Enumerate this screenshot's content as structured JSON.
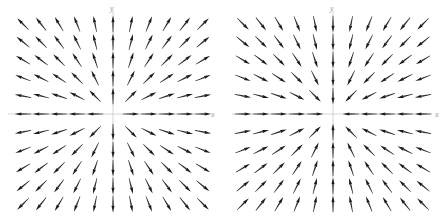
{
  "figure": {
    "width": 448,
    "height": 218,
    "background": "#ffffff",
    "panel_count": 2
  },
  "chart_data": [
    {
      "type": "scatter",
      "subtype": "quiver",
      "name": "outward-radial-vector-field",
      "title": "",
      "xlabel": "x",
      "ylabel": "y",
      "xlim": [
        -5,
        5
      ],
      "ylim": [
        -5,
        5
      ],
      "grid": false,
      "legend": null,
      "axis_color": "#cfcfcf",
      "arrow_color": "#262626",
      "description": "Radially outward (source) vector field: arrows point away from the origin",
      "field_direction": "outward",
      "field_formula": "F(x,y) = (x, y)",
      "grid_columns": 11,
      "grid_rows": 11,
      "x": [
        -5,
        -4,
        -3,
        -2,
        -1,
        0,
        1,
        2,
        3,
        4,
        5
      ],
      "y": [
        -5,
        -4,
        -3,
        -2,
        -1,
        0,
        1,
        2,
        3,
        4,
        5
      ],
      "arrow_length_mode": "uniform",
      "origin_arrow": "none"
    },
    {
      "type": "scatter",
      "subtype": "quiver",
      "name": "inward-radial-vector-field",
      "title": "",
      "xlabel": "x",
      "ylabel": "y",
      "xlim": [
        -5,
        5
      ],
      "ylim": [
        -5,
        5
      ],
      "grid": false,
      "legend": null,
      "axis_color": "#cfcfcf",
      "arrow_color": "#262626",
      "description": "Radially inward (sink) vector field: arrows point toward the origin",
      "field_direction": "inward",
      "field_formula": "F(x,y) = (-x, -y)",
      "grid_columns": 11,
      "grid_rows": 11,
      "x": [
        -5,
        -4,
        -3,
        -2,
        -1,
        0,
        1,
        2,
        3,
        4,
        5
      ],
      "y": [
        -5,
        -4,
        -3,
        -2,
        -1,
        0,
        1,
        2,
        3,
        4,
        5
      ],
      "arrow_length_mode": "uniform",
      "origin_arrow": "none"
    }
  ],
  "panels": [
    {
      "id": "left",
      "axis_x_label": "x",
      "axis_y_label": "y"
    },
    {
      "id": "right",
      "axis_x_label": "x",
      "axis_y_label": "y"
    }
  ]
}
